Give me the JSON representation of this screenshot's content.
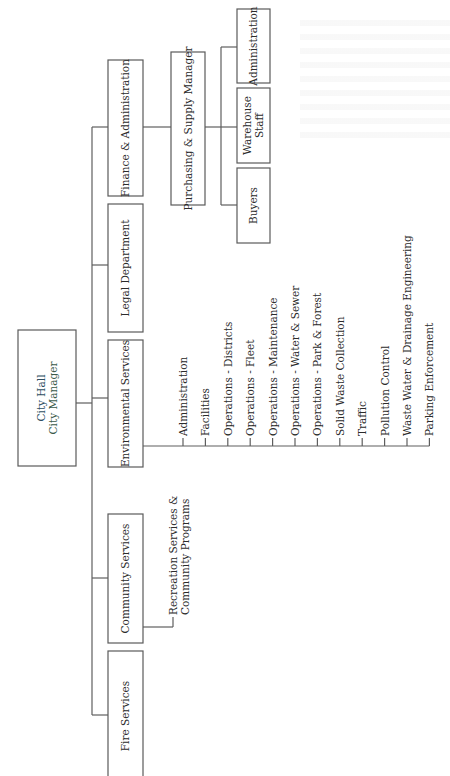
{
  "diagram": {
    "type": "org-chart",
    "orientation": "rotated-90-ccw",
    "colors": {
      "line": "#5e5e5e",
      "box_border": "#5a5a5a",
      "text": "#2b2b2b",
      "root_line1": "#2d4e62",
      "root_line2": "#3a5a4a"
    },
    "root": {
      "line1": "City Hall",
      "line2": "City Manager"
    },
    "departments": [
      {
        "id": "finance",
        "label": "Finance & Administration",
        "children": [
          {
            "id": "purchasing",
            "label": "Purchasing & Supply Manager",
            "children": [
              {
                "id": "pur-admin",
                "label": "Administration"
              },
              {
                "id": "warehouse",
                "label": "Warehouse Staff",
                "lines": [
                  "Warehouse",
                  "Staff"
                ]
              },
              {
                "id": "buyers",
                "label": "Buyers"
              }
            ]
          }
        ]
      },
      {
        "id": "legal",
        "label": "Legal Department",
        "children": []
      },
      {
        "id": "environmental",
        "label": "Environmental Services",
        "items": [
          "Administration",
          "Facilities",
          "Operations - Districts",
          "Operations - Fleet",
          "Operations - Maintenance",
          "Operations - Water & Sewer",
          "Operations - Park & Forest",
          "Solid Waste Collection",
          "Traffic",
          "Pollution Control",
          "Waste Water & Drainage Engineering",
          "Parking Enforcement"
        ]
      },
      {
        "id": "community",
        "label": "Community Services",
        "items_multiline": [
          [
            "Recreation Services &",
            "Community Programs"
          ]
        ]
      },
      {
        "id": "fire",
        "label": "Fire Services"
      }
    ]
  }
}
